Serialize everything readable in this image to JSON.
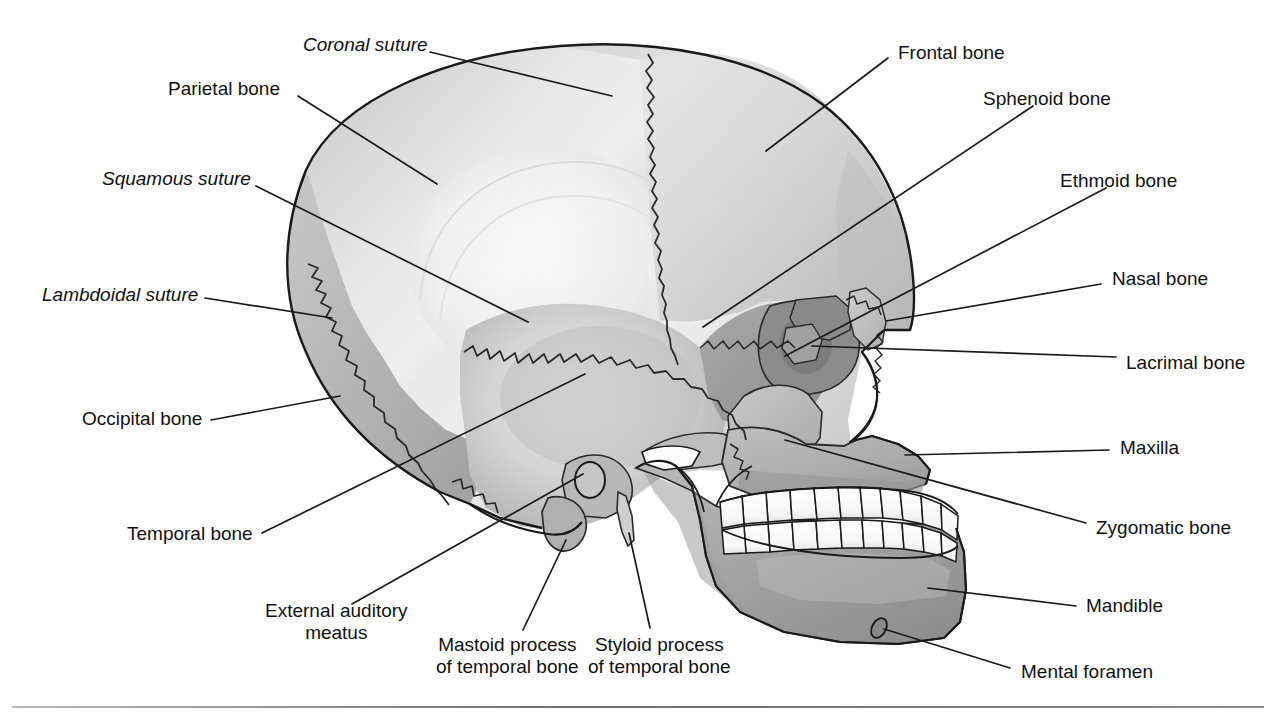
{
  "figure": {
    "background_color": "#ffffff",
    "line_color": "#1a1a1a"
  },
  "palette": {
    "parietal": "#d0d0d0",
    "parietal_highlight": "#ececec",
    "frontal": "#c6c6c6",
    "temporal": "#b4b4b4",
    "occipital": "#b0b0b0",
    "sphenoid": "#9a9a9a",
    "ethmoid": "#8e8e8e",
    "nasal": "#c2c2c2",
    "lacrimal": "#a6a6a6",
    "zygomatic": "#b8b8b8",
    "maxilla": "#a8a8a8",
    "mandible": "#9e9e9e",
    "teeth": "#fdfdfd",
    "outline": "#1a1a1a"
  },
  "labels": [
    {
      "id": "coronal-suture",
      "text": "Coronal suture",
      "style": "italic",
      "align": "left",
      "x": 303,
      "y": 34,
      "leader": [
        [
          430,
          52
        ],
        [
          612,
          96
        ]
      ]
    },
    {
      "id": "parietal-bone",
      "text": "Parietal bone",
      "style": "normal",
      "align": "left",
      "x": 168,
      "y": 78,
      "leader": [
        [
          298,
          96
        ],
        [
          437,
          184
        ]
      ]
    },
    {
      "id": "squamous-suture",
      "text": "Squamous suture",
      "style": "italic",
      "align": "left",
      "x": 102,
      "y": 168,
      "leader": [
        [
          256,
          186
        ],
        [
          528,
          322
        ]
      ]
    },
    {
      "id": "lambdoidal-suture",
      "text": "Lambdoidal suture",
      "style": "italic",
      "align": "left",
      "x": 42,
      "y": 284,
      "leader": [
        [
          205,
          298
        ],
        [
          332,
          318
        ]
      ]
    },
    {
      "id": "occipital-bone",
      "text": "Occipital bone",
      "style": "normal",
      "align": "left",
      "x": 82,
      "y": 408,
      "leader": [
        [
          211,
          420
        ],
        [
          340,
          396
        ]
      ]
    },
    {
      "id": "temporal-bone",
      "text": "Temporal bone",
      "style": "normal",
      "align": "left",
      "x": 127,
      "y": 523,
      "leader": [
        [
          262,
          533
        ],
        [
          585,
          374
        ]
      ]
    },
    {
      "id": "external-auditory-meatus",
      "text": "External auditory\nmeatus",
      "style": "normal",
      "align": "center",
      "x": 265,
      "y": 600,
      "leader": [
        [
          352,
          604
        ],
        [
          583,
          474
        ]
      ]
    },
    {
      "id": "mastoid-process",
      "text": "Mastoid process\nof temporal bone",
      "style": "normal",
      "align": "center",
      "x": 436,
      "y": 634,
      "leader": [
        [
          523,
          630
        ],
        [
          566,
          540
        ]
      ]
    },
    {
      "id": "styloid-process",
      "text": "Styloid process\nof temporal bone",
      "style": "normal",
      "align": "center",
      "x": 588,
      "y": 634,
      "leader": [
        [
          650,
          628
        ],
        [
          629,
          533
        ]
      ]
    },
    {
      "id": "frontal-bone",
      "text": "Frontal bone",
      "style": "normal",
      "align": "left",
      "x": 898,
      "y": 42,
      "leader": [
        [
          888,
          58
        ],
        [
          766,
          151
        ]
      ]
    },
    {
      "id": "sphenoid-bone",
      "text": "Sphenoid bone",
      "style": "normal",
      "align": "left",
      "x": 983,
      "y": 88,
      "leader": [
        [
          1033,
          106
        ],
        [
          703,
          327
        ]
      ]
    },
    {
      "id": "ethmoid-bone",
      "text": "Ethmoid bone",
      "style": "normal",
      "align": "left",
      "x": 1060,
      "y": 170,
      "leader": [
        [
          1106,
          188
        ],
        [
          785,
          356
        ]
      ]
    },
    {
      "id": "nasal-bone",
      "text": "Nasal bone",
      "style": "normal",
      "align": "left",
      "x": 1112,
      "y": 268,
      "leader": [
        [
          1101,
          284
        ],
        [
          886,
          321
        ]
      ]
    },
    {
      "id": "lacrimal-bone",
      "text": "Lacrimal bone",
      "style": "normal",
      "align": "left",
      "x": 1126,
      "y": 352,
      "leader": [
        [
          1116,
          357
        ],
        [
          812,
          346
        ]
      ]
    },
    {
      "id": "maxilla",
      "text": "Maxilla",
      "style": "normal",
      "align": "left",
      "x": 1120,
      "y": 437,
      "leader": [
        [
          1109,
          450
        ],
        [
          905,
          455
        ]
      ]
    },
    {
      "id": "zygomatic-bone",
      "text": "Zygomatic bone",
      "style": "normal",
      "align": "left",
      "x": 1096,
      "y": 517,
      "leader": [
        [
          1086,
          523
        ],
        [
          785,
          440
        ]
      ]
    },
    {
      "id": "mandible",
      "text": "Mandible",
      "style": "normal",
      "align": "left",
      "x": 1086,
      "y": 595,
      "leader": [
        [
          1076,
          606
        ],
        [
          928,
          588
        ]
      ]
    },
    {
      "id": "mental-foramen",
      "text": "Mental foramen",
      "style": "normal",
      "align": "left",
      "x": 1021,
      "y": 661,
      "leader": [
        [
          1010,
          668
        ],
        [
          884,
          629
        ]
      ]
    }
  ]
}
